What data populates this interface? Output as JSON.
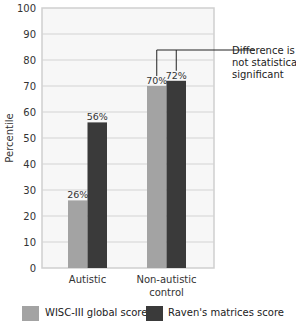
{
  "chart_data": {
    "type": "bar",
    "title": "",
    "xlabel": "",
    "ylabel": "Percentile",
    "ylim": [
      0,
      100
    ],
    "yticks": [
      0,
      10,
      20,
      30,
      40,
      50,
      60,
      70,
      80,
      90,
      100
    ],
    "grid": true,
    "categories": [
      "Autistic",
      "Non-autistic control"
    ],
    "series": [
      {
        "name": "WISC-III global score",
        "values": [
          26,
          70
        ],
        "labels": [
          "26%",
          "70%"
        ],
        "color": "#a3a3a3"
      },
      {
        "name": "Raven's matrices score",
        "values": [
          56,
          72
        ],
        "labels": [
          "56%",
          "72%"
        ],
        "color": "#3a3a3a"
      }
    ],
    "annotations": [
      {
        "text": "Difference is not statistically significant",
        "lines": [
          "Difference is",
          "not statistically",
          "significant"
        ],
        "target": "Non-autistic control"
      }
    ],
    "legend_position": "bottom"
  },
  "legend": {
    "items": [
      {
        "label": "WISC-III global score",
        "color": "#a3a3a3"
      },
      {
        "label": "Raven's matrices score",
        "color": "#3a3a3a"
      }
    ]
  }
}
